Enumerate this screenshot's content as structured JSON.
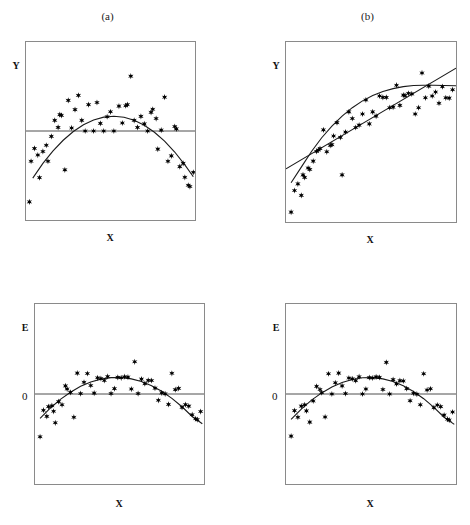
{
  "figure": {
    "background": "#ffffff",
    "marker_color": "#000000",
    "curve_color": "#1a1a1a",
    "frame_color": "#8a8a8a",
    "marker_glyph": "six-pointed-star"
  },
  "panels": [
    {
      "id": "panel-a",
      "title": "(a)",
      "ylabel": "Y",
      "xlabel": "X",
      "zero_label": "",
      "frame": {
        "x": 25,
        "y": 41,
        "w": 171,
        "h": 180
      }
    },
    {
      "id": "panel-b",
      "title": "(b)",
      "ylabel": "Y",
      "xlabel": "X",
      "zero_label": "",
      "frame": {
        "x": 285,
        "y": 41,
        "w": 172,
        "h": 182
      }
    },
    {
      "id": "panel-c",
      "title": "",
      "ylabel": "E",
      "xlabel": "X",
      "zero_label": "0",
      "frame": {
        "x": 34,
        "y": 303,
        "w": 171,
        "h": 182
      }
    },
    {
      "id": "panel-d",
      "title": "",
      "ylabel": "E",
      "xlabel": "X",
      "zero_label": "0",
      "frame": {
        "x": 285,
        "y": 303,
        "w": 172,
        "h": 182
      }
    }
  ],
  "chart_data": [
    {
      "type": "scatter",
      "id": "panel-a",
      "title": "(a)",
      "xlabel": "X",
      "ylabel": "Y",
      "xlim": [
        0,
        1
      ],
      "ylim": [
        0,
        1
      ],
      "grid": false,
      "legend": "none",
      "reference_line": {
        "type": "horizontal",
        "y": 0.5,
        "label": ""
      },
      "fit_curves": [
        {
          "name": "quadratic-fit",
          "shape": "concave-down",
          "points": [
            [
              0.04,
              0.235
            ],
            [
              0.1,
              0.318
            ],
            [
              0.16,
              0.388
            ],
            [
              0.22,
              0.448
            ],
            [
              0.28,
              0.497
            ],
            [
              0.34,
              0.535
            ],
            [
              0.4,
              0.562
            ],
            [
              0.46,
              0.578
            ],
            [
              0.52,
              0.583
            ],
            [
              0.58,
              0.577
            ],
            [
              0.64,
              0.56
            ],
            [
              0.7,
              0.532
            ],
            [
              0.76,
              0.493
            ],
            [
              0.82,
              0.443
            ],
            [
              0.88,
              0.382
            ],
            [
              0.94,
              0.31
            ],
            [
              0.99,
              0.243
            ]
          ]
        }
      ],
      "points": [
        [
          0.02,
          0.102
        ],
        [
          0.03,
          0.33
        ],
        [
          0.05,
          0.402
        ],
        [
          0.07,
          0.365
        ],
        [
          0.08,
          0.238
        ],
        [
          0.1,
          0.385
        ],
        [
          0.12,
          0.42
        ],
        [
          0.13,
          0.33
        ],
        [
          0.15,
          0.47
        ],
        [
          0.17,
          0.56
        ],
        [
          0.19,
          0.52
        ],
        [
          0.2,
          0.592
        ],
        [
          0.21,
          0.588
        ],
        [
          0.23,
          0.282
        ],
        [
          0.25,
          0.672
        ],
        [
          0.27,
          0.517
        ],
        [
          0.29,
          0.62
        ],
        [
          0.31,
          0.7
        ],
        [
          0.33,
          0.56
        ],
        [
          0.35,
          0.5
        ],
        [
          0.37,
          0.648
        ],
        [
          0.4,
          0.5
        ],
        [
          0.42,
          0.66
        ],
        [
          0.44,
          0.543
        ],
        [
          0.46,
          0.5
        ],
        [
          0.48,
          0.58
        ],
        [
          0.5,
          0.608
        ],
        [
          0.52,
          0.5
        ],
        [
          0.55,
          0.64
        ],
        [
          0.57,
          0.545
        ],
        [
          0.59,
          0.642
        ],
        [
          0.6,
          0.648
        ],
        [
          0.62,
          0.808
        ],
        [
          0.64,
          0.56
        ],
        [
          0.66,
          0.52
        ],
        [
          0.68,
          0.582
        ],
        [
          0.7,
          0.54
        ],
        [
          0.72,
          0.5
        ],
        [
          0.74,
          0.605
        ],
        [
          0.75,
          0.622
        ],
        [
          0.77,
          0.57
        ],
        [
          0.78,
          0.398
        ],
        [
          0.8,
          0.505
        ],
        [
          0.82,
          0.69
        ],
        [
          0.84,
          0.33
        ],
        [
          0.86,
          0.36
        ],
        [
          0.88,
          0.525
        ],
        [
          0.89,
          0.512
        ],
        [
          0.91,
          0.3
        ],
        [
          0.93,
          0.318
        ],
        [
          0.94,
          0.24
        ],
        [
          0.96,
          0.195
        ],
        [
          0.97,
          0.188
        ],
        [
          0.99,
          0.268
        ]
      ]
    },
    {
      "type": "scatter",
      "id": "panel-b",
      "title": "(b)",
      "xlabel": "X",
      "ylabel": "Y",
      "xlim": [
        0,
        1
      ],
      "ylim": [
        0,
        1
      ],
      "grid": false,
      "legend": "none",
      "fit_curves": [
        {
          "name": "linear-fit",
          "shape": "straight",
          "points": [
            [
              0.0,
              0.295
            ],
            [
              1.0,
              0.855
            ]
          ]
        },
        {
          "name": "curved-fit",
          "shape": "concave-down",
          "points": [
            [
              0.03,
              0.218
            ],
            [
              0.09,
              0.305
            ],
            [
              0.15,
              0.392
            ],
            [
              0.21,
              0.468
            ],
            [
              0.27,
              0.533
            ],
            [
              0.33,
              0.588
            ],
            [
              0.39,
              0.635
            ],
            [
              0.45,
              0.673
            ],
            [
              0.51,
              0.703
            ],
            [
              0.57,
              0.725
            ],
            [
              0.63,
              0.741
            ],
            [
              0.69,
              0.752
            ],
            [
              0.75,
              0.758
            ],
            [
              0.81,
              0.76
            ],
            [
              0.87,
              0.76
            ],
            [
              0.93,
              0.758
            ],
            [
              1.0,
              0.757
            ]
          ]
        }
      ],
      "points": [
        [
          0.03,
          0.055
        ],
        [
          0.05,
          0.175
        ],
        [
          0.07,
          0.212
        ],
        [
          0.09,
          0.148
        ],
        [
          0.1,
          0.262
        ],
        [
          0.11,
          0.248
        ],
        [
          0.13,
          0.3
        ],
        [
          0.14,
          0.292
        ],
        [
          0.16,
          0.338
        ],
        [
          0.18,
          0.392
        ],
        [
          0.19,
          0.4
        ],
        [
          0.2,
          0.408
        ],
        [
          0.22,
          0.512
        ],
        [
          0.24,
          0.39
        ],
        [
          0.26,
          0.425
        ],
        [
          0.27,
          0.43
        ],
        [
          0.28,
          0.478
        ],
        [
          0.3,
          0.552
        ],
        [
          0.32,
          0.47
        ],
        [
          0.33,
          0.262
        ],
        [
          0.35,
          0.5
        ],
        [
          0.37,
          0.612
        ],
        [
          0.39,
          0.575
        ],
        [
          0.41,
          0.525
        ],
        [
          0.43,
          0.538
        ],
        [
          0.45,
          0.6
        ],
        [
          0.47,
          0.678
        ],
        [
          0.49,
          0.545
        ],
        [
          0.51,
          0.612
        ],
        [
          0.53,
          0.588
        ],
        [
          0.55,
          0.7
        ],
        [
          0.57,
          0.692
        ],
        [
          0.59,
          0.692
        ],
        [
          0.61,
          0.635
        ],
        [
          0.63,
          0.638
        ],
        [
          0.65,
          0.76
        ],
        [
          0.67,
          0.648
        ],
        [
          0.69,
          0.705
        ],
        [
          0.7,
          0.702
        ],
        [
          0.72,
          0.715
        ],
        [
          0.74,
          0.712
        ],
        [
          0.76,
          0.6
        ],
        [
          0.78,
          0.635
        ],
        [
          0.8,
          0.828
        ],
        [
          0.82,
          0.69
        ],
        [
          0.84,
          0.755
        ],
        [
          0.86,
          0.7
        ],
        [
          0.88,
          0.722
        ],
        [
          0.9,
          0.66
        ],
        [
          0.92,
          0.752
        ],
        [
          0.94,
          0.69
        ],
        [
          0.96,
          0.688
        ],
        [
          0.98,
          0.735
        ]
      ]
    },
    {
      "type": "scatter",
      "id": "panel-c",
      "title": "",
      "xlabel": "X",
      "ylabel": "E",
      "xlim": [
        0,
        1
      ],
      "ylim": [
        -1,
        1
      ],
      "grid": false,
      "legend": "none",
      "reference_line": {
        "type": "horizontal",
        "y": 0.0,
        "label": "0"
      },
      "fit_curves": [
        {
          "name": "quadratic-fit",
          "shape": "concave-down",
          "points": [
            [
              0.03,
              -0.272
            ],
            [
              0.09,
              -0.158
            ],
            [
              0.15,
              -0.06
            ],
            [
              0.21,
              0.02
            ],
            [
              0.27,
              0.085
            ],
            [
              0.33,
              0.133
            ],
            [
              0.39,
              0.165
            ],
            [
              0.45,
              0.182
            ],
            [
              0.51,
              0.183
            ],
            [
              0.57,
              0.168
            ],
            [
              0.63,
              0.138
            ],
            [
              0.69,
              0.092
            ],
            [
              0.75,
              0.03
            ],
            [
              0.81,
              -0.048
            ],
            [
              0.87,
              -0.142
            ],
            [
              0.93,
              -0.25
            ],
            [
              0.99,
              -0.33
            ]
          ]
        }
      ],
      "points": [
        [
          0.03,
          -0.475
        ],
        [
          0.05,
          -0.18
        ],
        [
          0.07,
          -0.248
        ],
        [
          0.08,
          -0.14
        ],
        [
          0.1,
          -0.13
        ],
        [
          0.11,
          -0.192
        ],
        [
          0.12,
          -0.32
        ],
        [
          0.14,
          -0.085
        ],
        [
          0.16,
          -0.12
        ],
        [
          0.18,
          0.09
        ],
        [
          0.19,
          0.055
        ],
        [
          0.21,
          0.018
        ],
        [
          0.23,
          -0.258
        ],
        [
          0.25,
          0.232
        ],
        [
          0.27,
          0.005
        ],
        [
          0.29,
          0.13
        ],
        [
          0.31,
          0.228
        ],
        [
          0.33,
          0.095
        ],
        [
          0.35,
          0.01
        ],
        [
          0.37,
          0.18
        ],
        [
          0.39,
          0.172
        ],
        [
          0.41,
          0.15
        ],
        [
          0.43,
          0.195
        ],
        [
          0.45,
          0.005
        ],
        [
          0.47,
          0.06
        ],
        [
          0.49,
          0.185
        ],
        [
          0.51,
          0.18
        ],
        [
          0.53,
          0.192
        ],
        [
          0.55,
          0.188
        ],
        [
          0.57,
          0.055
        ],
        [
          0.59,
          0.358
        ],
        [
          0.61,
          0.005
        ],
        [
          0.63,
          0.165
        ],
        [
          0.65,
          0.115
        ],
        [
          0.67,
          0.152
        ],
        [
          0.69,
          0.15
        ],
        [
          0.71,
          0.065
        ],
        [
          0.73,
          -0.07
        ],
        [
          0.75,
          0.012
        ],
        [
          0.77,
          0.002
        ],
        [
          0.79,
          -0.115
        ],
        [
          0.81,
          0.23
        ],
        [
          0.83,
          0.048
        ],
        [
          0.85,
          0.062
        ],
        [
          0.87,
          -0.148
        ],
        [
          0.89,
          -0.118
        ],
        [
          0.91,
          -0.135
        ],
        [
          0.93,
          -0.23
        ],
        [
          0.95,
          -0.275
        ],
        [
          0.96,
          -0.285
        ],
        [
          0.98,
          -0.195
        ]
      ]
    },
    {
      "type": "scatter",
      "id": "panel-d",
      "title": "",
      "xlabel": "X",
      "ylabel": "E",
      "xlim": [
        0,
        1
      ],
      "ylim": [
        -1,
        1
      ],
      "grid": false,
      "legend": "none",
      "reference_line": {
        "type": "horizontal",
        "y": 0.0,
        "label": "0"
      },
      "fit_curves": [
        {
          "name": "quadratic-fit",
          "shape": "concave-down",
          "points": [
            [
              0.03,
              -0.282
            ],
            [
              0.09,
              -0.168
            ],
            [
              0.15,
              -0.068
            ],
            [
              0.21,
              0.012
            ],
            [
              0.27,
              0.078
            ],
            [
              0.33,
              0.128
            ],
            [
              0.39,
              0.162
            ],
            [
              0.45,
              0.18
            ],
            [
              0.51,
              0.182
            ],
            [
              0.57,
              0.168
            ],
            [
              0.63,
              0.138
            ],
            [
              0.69,
              0.092
            ],
            [
              0.75,
              0.028
            ],
            [
              0.81,
              -0.052
            ],
            [
              0.87,
              -0.148
            ],
            [
              0.93,
              -0.258
            ],
            [
              0.99,
              -0.338
            ]
          ]
        }
      ],
      "points": [
        [
          0.03,
          -0.468
        ],
        [
          0.05,
          -0.185
        ],
        [
          0.07,
          -0.258
        ],
        [
          0.09,
          -0.135
        ],
        [
          0.11,
          -0.12
        ],
        [
          0.12,
          -0.188
        ],
        [
          0.14,
          -0.312
        ],
        [
          0.16,
          -0.078
        ],
        [
          0.18,
          0.085
        ],
        [
          0.2,
          0.05
        ],
        [
          0.21,
          0.015
        ],
        [
          0.23,
          -0.255
        ],
        [
          0.25,
          0.225
        ],
        [
          0.27,
          0.0
        ],
        [
          0.29,
          0.125
        ],
        [
          0.31,
          0.232
        ],
        [
          0.33,
          0.09
        ],
        [
          0.35,
          0.005
        ],
        [
          0.37,
          0.178
        ],
        [
          0.39,
          0.168
        ],
        [
          0.41,
          0.148
        ],
        [
          0.43,
          0.192
        ],
        [
          0.45,
          0.0
        ],
        [
          0.47,
          0.055
        ],
        [
          0.49,
          0.182
        ],
        [
          0.51,
          0.178
        ],
        [
          0.53,
          0.19
        ],
        [
          0.55,
          0.185
        ],
        [
          0.57,
          0.05
        ],
        [
          0.59,
          0.352
        ],
        [
          0.61,
          0.0
        ],
        [
          0.63,
          0.16
        ],
        [
          0.65,
          0.112
        ],
        [
          0.67,
          0.148
        ],
        [
          0.69,
          0.145
        ],
        [
          0.71,
          0.06
        ],
        [
          0.73,
          -0.075
        ],
        [
          0.75,
          0.008
        ],
        [
          0.77,
          -0.002
        ],
        [
          0.79,
          -0.12
        ],
        [
          0.81,
          0.225
        ],
        [
          0.83,
          0.045
        ],
        [
          0.85,
          0.058
        ],
        [
          0.87,
          -0.152
        ],
        [
          0.89,
          -0.122
        ],
        [
          0.91,
          -0.14
        ],
        [
          0.93,
          -0.235
        ],
        [
          0.95,
          -0.28
        ],
        [
          0.96,
          -0.29
        ],
        [
          0.98,
          -0.2
        ]
      ]
    }
  ]
}
